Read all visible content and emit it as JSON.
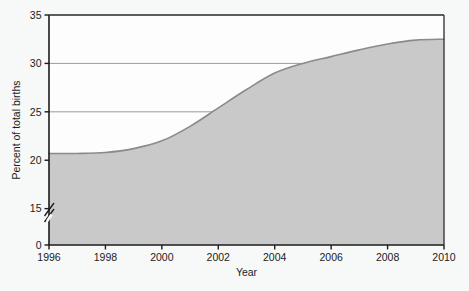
{
  "chart_data": {
    "type": "area",
    "title": "",
    "xlabel": "Year",
    "ylabel": "Percent of total births",
    "x": [
      1996,
      1997,
      1998,
      1999,
      2000,
      2001,
      2002,
      2003,
      2004,
      2005,
      2006,
      2007,
      2008,
      2009,
      2010
    ],
    "values": [
      20.7,
      20.7,
      20.8,
      21.2,
      22.0,
      23.5,
      25.4,
      27.3,
      29.0,
      30.0,
      30.7,
      31.4,
      32.0,
      32.4,
      32.5
    ],
    "series": [
      {
        "name": "Percent of total births",
        "values": [
          20.7,
          20.7,
          20.8,
          21.2,
          22.0,
          23.5,
          25.4,
          27.3,
          29.0,
          30.0,
          30.7,
          31.4,
          32.0,
          32.4,
          32.5
        ]
      }
    ],
    "xlim": [
      1996,
      2010
    ],
    "ylim": [
      0,
      35
    ],
    "xticks": [
      1996,
      1998,
      2000,
      2002,
      2004,
      2006,
      2008,
      2010
    ],
    "xtick_labels": [
      "1996",
      "1998",
      "2000",
      "2002",
      "2004",
      "2006",
      "2008",
      "2010"
    ],
    "yticks": [
      0,
      15,
      20,
      25,
      30,
      35
    ],
    "ytick_labels": [
      "0",
      "15",
      "20",
      "25",
      "30",
      "35"
    ],
    "y_axis_break": true,
    "y_axis_break_between": [
      0,
      15
    ],
    "grid": true,
    "grid_axis": "y",
    "legend": false,
    "legend_position": "none",
    "colors": {
      "area_fill": "#c9c9c9",
      "area_line": "#8a8a8a",
      "gridline": "#7a7a7a",
      "axis": "#1b1b1b",
      "background": "#f7f8f8",
      "plot_background": "#fdfdfd",
      "text": "#1b1b1b"
    }
  }
}
